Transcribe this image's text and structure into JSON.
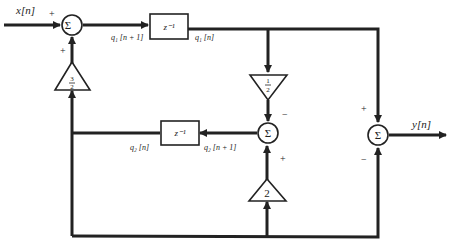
{
  "diagram": {
    "type": "signal-flow block diagram",
    "input_label": "x[n]",
    "output_label": "y[n]",
    "summer_symbol": "Σ",
    "delay_label": "z⁻¹",
    "signals": {
      "q1_next": "q₁ [n + 1]",
      "q1": "q₁ [n]",
      "q2_next": "q₂ [n + 1]",
      "q2": "q₂ [n]"
    },
    "gains": {
      "g_three_halves_num": "3",
      "g_three_halves_den": "2",
      "g_half_num": "1",
      "g_half_den": "2",
      "g_two": "2"
    },
    "signs": {
      "top_sum_input": "+",
      "top_sum_feedback": "+",
      "mid_sum_half": "−",
      "mid_sum_two": "+",
      "out_sum_q1": "+",
      "out_sum_bottom": "−"
    }
  }
}
